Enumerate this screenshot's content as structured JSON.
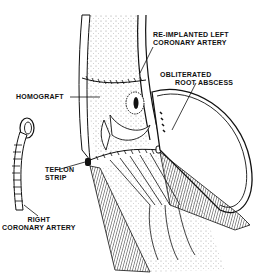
{
  "figure": {
    "type": "surgical illustration",
    "background": "#ffffff",
    "ink": "#111111"
  },
  "labels": {
    "reimplanted_line1": "RE-IMPLANTED LEFT",
    "reimplanted_line2": "CORONARY ARTERY",
    "obliterated_line1": "OBLITERATED",
    "obliterated_line2": "ROOT ABSCESS",
    "homograft": "HOMOGRAFT",
    "teflon_line1": "TEFLON",
    "teflon_line2": "STRIP",
    "right_coronary_line1": "RIGHT",
    "right_coronary_line2": "CORONARY ARTERY"
  }
}
